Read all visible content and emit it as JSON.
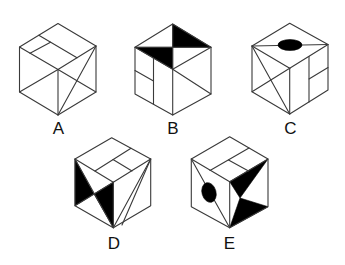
{
  "figure": {
    "stroke_color": "#3a3a3a",
    "fill_color": "#000000",
    "background": "#ffffff"
  },
  "options": [
    {
      "id": "A",
      "label": "A"
    },
    {
      "id": "B",
      "label": "B"
    },
    {
      "id": "C",
      "label": "C"
    },
    {
      "id": "D",
      "label": "D"
    },
    {
      "id": "E",
      "label": "E"
    }
  ]
}
